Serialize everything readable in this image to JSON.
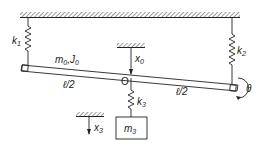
{
  "diagram": {
    "type": "mechanical-vibration-schematic",
    "colors": {
      "line": "#222222",
      "hatch": "#555555",
      "background": "#ffffff"
    },
    "labels": {
      "k1": {
        "base": "k",
        "sub": "1"
      },
      "k2": {
        "base": "k",
        "sub": "2"
      },
      "k3": {
        "base": "k",
        "sub": "3"
      },
      "m0": {
        "base": "m",
        "sub": "0"
      },
      "j0": {
        "base": "J",
        "sub": "0"
      },
      "sep": ",",
      "m3": {
        "base": "m",
        "sub": "3"
      },
      "x0": {
        "base": "x",
        "sub": "0"
      },
      "x3": {
        "base": "x",
        "sub": "3"
      },
      "pivot": "O",
      "half_left": "ℓ/2",
      "half_right": "ℓ/2",
      "theta": "θ"
    },
    "components": [
      {
        "id": "ceiling",
        "kind": "fixed-support"
      },
      {
        "id": "spring-k1",
        "kind": "spring",
        "connects": [
          "ceiling",
          "beam-left-end"
        ]
      },
      {
        "id": "spring-k2",
        "kind": "spring",
        "connects": [
          "ceiling",
          "beam-right-end"
        ]
      },
      {
        "id": "beam",
        "kind": "rigid-bar",
        "mass": "m0",
        "inertia": "J0",
        "length_segments": [
          "ℓ/2",
          "ℓ/2"
        ]
      },
      {
        "id": "spring-k3",
        "kind": "spring",
        "connects": [
          "beam-center-O",
          "mass-m3"
        ]
      },
      {
        "id": "mass-m3",
        "kind": "block"
      },
      {
        "id": "ref-x0",
        "kind": "displacement-reference"
      },
      {
        "id": "ref-x3",
        "kind": "displacement-reference"
      },
      {
        "id": "rotation-theta",
        "kind": "rotation-arrow"
      }
    ]
  }
}
